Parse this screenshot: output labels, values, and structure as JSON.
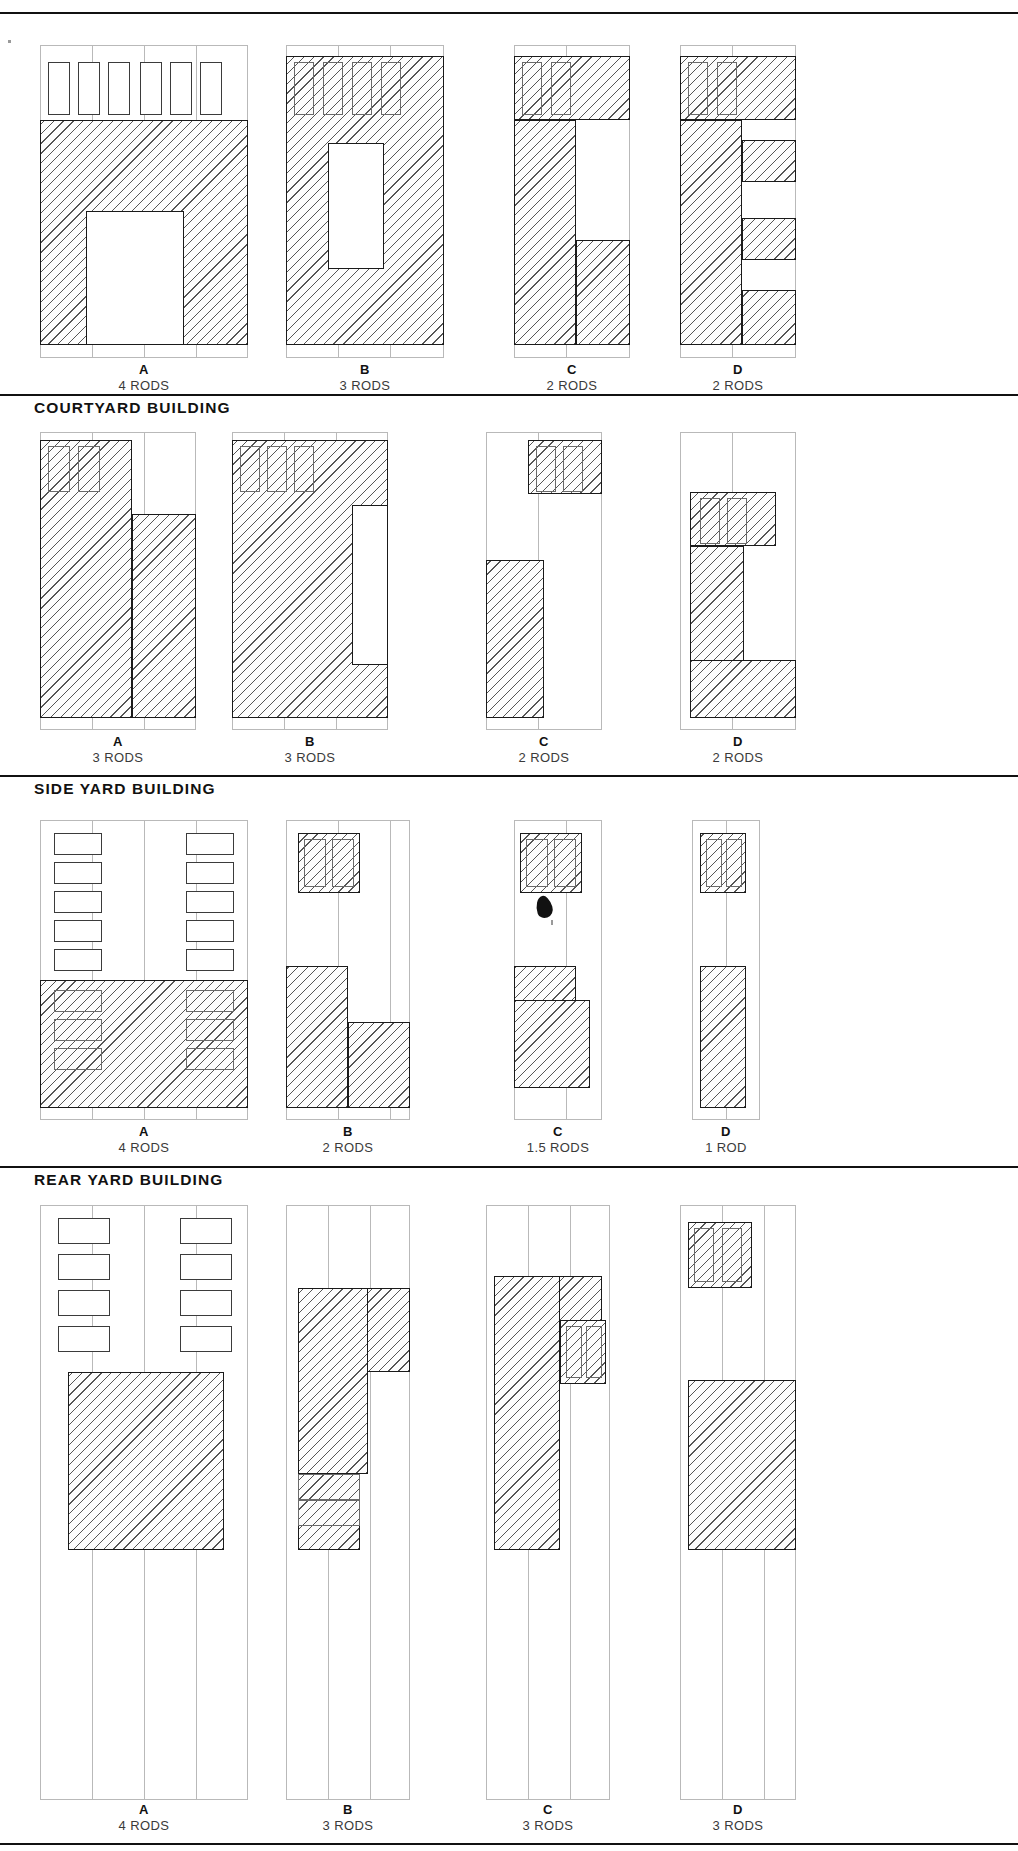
{
  "document": {
    "title": "Building Type Lot Coverage Diagrams",
    "sheet_kind": "architectural-typology-plate"
  },
  "sections": [
    {
      "id": "row1",
      "header": "",
      "header_visible": false,
      "variants": [
        {
          "letter": "A",
          "rods": "4 RODS"
        },
        {
          "letter": "B",
          "rods": "3 RODS"
        },
        {
          "letter": "C",
          "rods": "2 RODS"
        },
        {
          "letter": "D",
          "rods": "2 RODS"
        }
      ]
    },
    {
      "id": "row2",
      "header": "COURTYARD BUILDING",
      "header_visible": true,
      "variants": [
        {
          "letter": "A",
          "rods": "3 RODS"
        },
        {
          "letter": "B",
          "rods": "3 RODS"
        },
        {
          "letter": "C",
          "rods": "2 RODS"
        },
        {
          "letter": "D",
          "rods": "2 RODS"
        }
      ]
    },
    {
      "id": "row3",
      "header": "SIDE YARD BUILDING",
      "header_visible": true,
      "variants": [
        {
          "letter": "A",
          "rods": "4 RODS"
        },
        {
          "letter": "B",
          "rods": "2 RODS"
        },
        {
          "letter": "C",
          "rods": "1.5 RODS"
        },
        {
          "letter": "D",
          "rods": "1 ROD"
        }
      ]
    },
    {
      "id": "row4",
      "header": "REAR YARD BUILDING",
      "header_visible": true,
      "variants": [
        {
          "letter": "A",
          "rods": "4 RODS"
        },
        {
          "letter": "B",
          "rods": "3 RODS"
        },
        {
          "letter": "C",
          "rods": "3 RODS"
        },
        {
          "letter": "D",
          "rods": "3 RODS"
        }
      ]
    }
  ]
}
